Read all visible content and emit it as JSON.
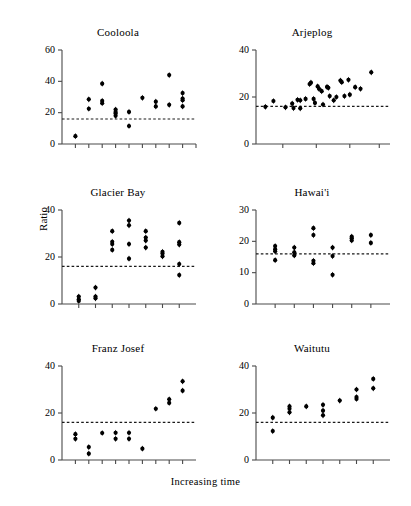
{
  "figure": {
    "xlabel": "Increasing time",
    "ylabel": "Ratio",
    "panel_titles": {
      "cooloola": "Cooloola",
      "arjeplog": "Arjeplog",
      "glacier_bay": "Glacier Bay",
      "hawaii": "Hawai'i",
      "franz_josef": "Franz Josef",
      "waitutu": "Waitutu"
    },
    "dot_color": "#000000",
    "axis_color": "#4a4a4a",
    "reference_line_color": "#1a1a1a"
  },
  "chart_data": [
    {
      "type": "scatter",
      "title": "Cooloola",
      "xlabel": "Increasing time",
      "ylabel": "Ratio",
      "ylim": [
        0,
        60
      ],
      "yticks": [
        0,
        20,
        40,
        60
      ],
      "xlim": [
        0,
        10
      ],
      "xticks": [
        1,
        2,
        3,
        4,
        5,
        6,
        7,
        8,
        9,
        10
      ],
      "grid": false,
      "legend": "none",
      "reference_line": 16,
      "points": [
        {
          "x": 1,
          "y": 5
        },
        {
          "x": 2,
          "y": 28.5
        },
        {
          "x": 2,
          "y": 22.5
        },
        {
          "x": 3,
          "y": 38.5
        },
        {
          "x": 3,
          "y": 27.5
        },
        {
          "x": 3,
          "y": 26
        },
        {
          "x": 4,
          "y": 22
        },
        {
          "x": 4,
          "y": 20.5
        },
        {
          "x": 4,
          "y": 19.5
        },
        {
          "x": 4,
          "y": 18
        },
        {
          "x": 5,
          "y": 20.5
        },
        {
          "x": 5,
          "y": 11.5
        },
        {
          "x": 6,
          "y": 29.5
        },
        {
          "x": 7,
          "y": 27
        },
        {
          "x": 7,
          "y": 24
        },
        {
          "x": 8,
          "y": 44
        },
        {
          "x": 8,
          "y": 25
        },
        {
          "x": 9,
          "y": 32.5
        },
        {
          "x": 9,
          "y": 29
        },
        {
          "x": 9,
          "y": 28
        },
        {
          "x": 9,
          "y": 24
        }
      ]
    },
    {
      "type": "scatter",
      "title": "Arjeplog",
      "xlabel": "Increasing time",
      "ylabel": "Ratio",
      "ylim": [
        0,
        40
      ],
      "yticks": [
        0,
        20,
        40
      ],
      "xlim": [
        0,
        10
      ],
      "xticks": [
        2,
        4.5,
        7,
        9.2
      ],
      "grid": false,
      "legend": "none",
      "reference_line": 16,
      "points": [
        {
          "x": 0.7,
          "y": 15.8
        },
        {
          "x": 1.3,
          "y": 18.3
        },
        {
          "x": 2.2,
          "y": 15.6
        },
        {
          "x": 2.7,
          "y": 17.2
        },
        {
          "x": 2.8,
          "y": 15.3
        },
        {
          "x": 3.1,
          "y": 18.8
        },
        {
          "x": 3.3,
          "y": 18.6
        },
        {
          "x": 3.3,
          "y": 15.2
        },
        {
          "x": 3.7,
          "y": 19.2
        },
        {
          "x": 4.0,
          "y": 25.5
        },
        {
          "x": 4.1,
          "y": 26.1
        },
        {
          "x": 4.3,
          "y": 19.2
        },
        {
          "x": 4.4,
          "y": 17.5
        },
        {
          "x": 4.6,
          "y": 24.5
        },
        {
          "x": 4.7,
          "y": 23.5
        },
        {
          "x": 4.9,
          "y": 22.5
        },
        {
          "x": 5.0,
          "y": 16.8
        },
        {
          "x": 5.3,
          "y": 24.3
        },
        {
          "x": 5.4,
          "y": 23.9
        },
        {
          "x": 5.5,
          "y": 20.4
        },
        {
          "x": 5.8,
          "y": 18.6
        },
        {
          "x": 6.0,
          "y": 20.0
        },
        {
          "x": 6.3,
          "y": 27.0
        },
        {
          "x": 6.4,
          "y": 26.3
        },
        {
          "x": 6.6,
          "y": 20.4
        },
        {
          "x": 6.9,
          "y": 27.3
        },
        {
          "x": 7.0,
          "y": 21.0
        },
        {
          "x": 7.4,
          "y": 24.2
        },
        {
          "x": 7.8,
          "y": 23.5
        },
        {
          "x": 8.6,
          "y": 30.5
        }
      ]
    },
    {
      "type": "scatter",
      "title": "Glacier Bay",
      "xlabel": "Increasing time",
      "ylabel": "Ratio",
      "ylim": [
        0,
        40
      ],
      "yticks": [
        0,
        20,
        40
      ],
      "xlim": [
        0,
        8
      ],
      "xticks": [
        1,
        2,
        3,
        4,
        5,
        6,
        7
      ],
      "grid": false,
      "legend": "none",
      "reference_line": 16,
      "points": [
        {
          "x": 1,
          "y": 3.2
        },
        {
          "x": 1,
          "y": 2.0
        },
        {
          "x": 1,
          "y": 1.3
        },
        {
          "x": 2,
          "y": 7.0
        },
        {
          "x": 2,
          "y": 3.2
        },
        {
          "x": 2,
          "y": 2.4
        },
        {
          "x": 3,
          "y": 31.0
        },
        {
          "x": 3,
          "y": 26.5
        },
        {
          "x": 3,
          "y": 25.5
        },
        {
          "x": 3,
          "y": 23.0
        },
        {
          "x": 4,
          "y": 35.5
        },
        {
          "x": 4,
          "y": 33.5
        },
        {
          "x": 4,
          "y": 25.5
        },
        {
          "x": 4,
          "y": 19.3
        },
        {
          "x": 5,
          "y": 31.0
        },
        {
          "x": 5,
          "y": 28.3
        },
        {
          "x": 5,
          "y": 27.0
        },
        {
          "x": 5,
          "y": 24.0
        },
        {
          "x": 6,
          "y": 22.2
        },
        {
          "x": 6,
          "y": 21.5
        },
        {
          "x": 6,
          "y": 20.3
        },
        {
          "x": 7,
          "y": 34.5
        },
        {
          "x": 7,
          "y": 26.3
        },
        {
          "x": 7,
          "y": 25.3
        },
        {
          "x": 7,
          "y": 17.0
        },
        {
          "x": 7,
          "y": 12.3
        }
      ]
    },
    {
      "type": "scatter",
      "title": "Hawai'i",
      "xlabel": "Increasing time",
      "ylabel": "Ratio",
      "ylim": [
        0,
        30
      ],
      "yticks": [
        0,
        10,
        20,
        30
      ],
      "xlim": [
        0,
        7
      ],
      "xticks": [
        1,
        2,
        3,
        4,
        5,
        6
      ],
      "grid": false,
      "legend": "none",
      "reference_line": 16,
      "points": [
        {
          "x": 1,
          "y": 18.5
        },
        {
          "x": 1,
          "y": 17.5
        },
        {
          "x": 1,
          "y": 16.8
        },
        {
          "x": 1,
          "y": 14.0
        },
        {
          "x": 2,
          "y": 18.0
        },
        {
          "x": 2,
          "y": 16.5
        },
        {
          "x": 2,
          "y": 15.5
        },
        {
          "x": 3,
          "y": 24.2
        },
        {
          "x": 3,
          "y": 22.0
        },
        {
          "x": 3,
          "y": 13.8
        },
        {
          "x": 3,
          "y": 13.0
        },
        {
          "x": 4,
          "y": 18.0
        },
        {
          "x": 4,
          "y": 15.3
        },
        {
          "x": 4,
          "y": 9.3
        },
        {
          "x": 5,
          "y": 21.5
        },
        {
          "x": 5,
          "y": 21.0
        },
        {
          "x": 5,
          "y": 20.3
        },
        {
          "x": 6,
          "y": 22.0
        },
        {
          "x": 6,
          "y": 19.5
        }
      ]
    },
    {
      "type": "scatter",
      "title": "Franz Josef",
      "xlabel": "Increasing time",
      "ylabel": "Ratio",
      "ylim": [
        0,
        40
      ],
      "yticks": [
        0,
        20,
        40
      ],
      "xlim": [
        0,
        10
      ],
      "xticks": [
        1,
        2,
        3,
        4,
        5,
        6,
        7,
        8,
        9
      ],
      "grid": false,
      "legend": "none",
      "reference_line": 16,
      "points": [
        {
          "x": 1,
          "y": 11.0
        },
        {
          "x": 1,
          "y": 9.0
        },
        {
          "x": 2,
          "y": 5.5
        },
        {
          "x": 2,
          "y": 2.7
        },
        {
          "x": 3,
          "y": 11.5
        },
        {
          "x": 4,
          "y": 11.6
        },
        {
          "x": 4,
          "y": 9.0
        },
        {
          "x": 5,
          "y": 11.6
        },
        {
          "x": 5,
          "y": 9.0
        },
        {
          "x": 6,
          "y": 4.8
        },
        {
          "x": 7,
          "y": 21.8
        },
        {
          "x": 8,
          "y": 25.8
        },
        {
          "x": 8,
          "y": 24.3
        },
        {
          "x": 9,
          "y": 33.5
        },
        {
          "x": 9,
          "y": 29.5
        }
      ]
    },
    {
      "type": "scatter",
      "title": "Waitutu",
      "xlabel": "Increasing time",
      "ylabel": "Ratio",
      "ylim": [
        0,
        40
      ],
      "yticks": [
        0,
        20,
        40
      ],
      "xlim": [
        0,
        8
      ],
      "xticks": [
        1,
        2,
        3,
        4,
        5,
        6,
        7
      ],
      "grid": false,
      "legend": "none",
      "reference_line": 16,
      "points": [
        {
          "x": 1,
          "y": 18.0
        },
        {
          "x": 1,
          "y": 12.3
        },
        {
          "x": 2,
          "y": 22.8
        },
        {
          "x": 2,
          "y": 21.8
        },
        {
          "x": 2,
          "y": 20.3
        },
        {
          "x": 3,
          "y": 22.8
        },
        {
          "x": 4,
          "y": 23.5
        },
        {
          "x": 4,
          "y": 21.0
        },
        {
          "x": 4,
          "y": 19.0
        },
        {
          "x": 5,
          "y": 25.3
        },
        {
          "x": 6,
          "y": 30.0
        },
        {
          "x": 6,
          "y": 26.8
        },
        {
          "x": 6,
          "y": 26.0
        },
        {
          "x": 7,
          "y": 34.5
        },
        {
          "x": 7,
          "y": 30.5
        }
      ]
    }
  ]
}
